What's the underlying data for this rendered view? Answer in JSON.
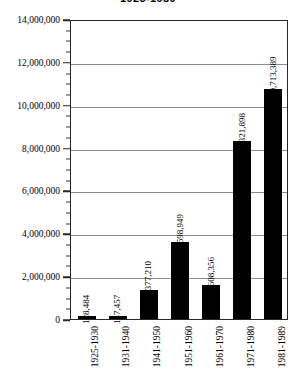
{
  "chart_data": {
    "type": "bar",
    "title": "1925-1989",
    "xlabel": "",
    "ylabel": "",
    "categories": [
      "1925-1930",
      "1931-1940",
      "1941-1950",
      "1951-1960",
      "1961-1970",
      "1971-1980",
      "1981-1989"
    ],
    "values": [
      128484,
      147457,
      1377210,
      3598949,
      1608356,
      8321898,
      10713389
    ],
    "value_labels": [
      "128,484",
      "147,457",
      "1,377,210",
      "3,598,949",
      "1,608,356",
      "8,321,898",
      "10,713,389"
    ],
    "ylim": [
      0,
      14000000
    ],
    "ytick_values": [
      0,
      2000000,
      4000000,
      6000000,
      8000000,
      10000000,
      12000000,
      14000000
    ],
    "ytick_labels": [
      "0",
      "2,000,000",
      "4,000,000",
      "6,000,000",
      "8,000,000",
      "10,000,000",
      "12,000,000",
      "14,000,000"
    ],
    "minor_tick_interval": 500000,
    "grid": true,
    "grid_axis": "y",
    "legend": false,
    "bar_color": "#000000",
    "grid_color": "#8c8c8c",
    "frame_color": "#262626",
    "background_color": "#ffffff",
    "label_rotation": 90
  }
}
